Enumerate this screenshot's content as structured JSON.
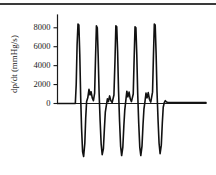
{
  "chart_data": {
    "type": "line",
    "title": "",
    "xlabel": "",
    "ylabel": "dp/dt  (mmHg/s)",
    "ylim": [
      -6000,
      9000
    ],
    "xlim": [
      0,
      100
    ],
    "grid": false,
    "legend": null,
    "yticks": [
      0,
      2000,
      4000,
      6000,
      8000
    ],
    "ytick_labels": [
      "0",
      "2000",
      "4000",
      "6000",
      "8000"
    ],
    "xticks": [],
    "xtick_labels": [],
    "series": [
      {
        "name": "dp/dt",
        "points": [
          [
            0.0,
            0
          ],
          [
            12.0,
            0
          ],
          [
            12.6,
            2000
          ],
          [
            13.2,
            6200
          ],
          [
            13.8,
            8400
          ],
          [
            14.4,
            8300
          ],
          [
            15.0,
            5200
          ],
          [
            15.6,
            700
          ],
          [
            16.2,
            -2600
          ],
          [
            16.9,
            -5100
          ],
          [
            17.6,
            -5600
          ],
          [
            18.4,
            -4200
          ],
          [
            19.0,
            -1500
          ],
          [
            19.6,
            200
          ],
          [
            20.4,
            600
          ],
          [
            21.2,
            1500
          ],
          [
            21.9,
            900
          ],
          [
            22.6,
            1250
          ],
          [
            23.4,
            600
          ],
          [
            24.2,
            300
          ],
          [
            25.0,
            1100
          ],
          [
            25.6,
            4800
          ],
          [
            26.2,
            8200
          ],
          [
            26.8,
            8000
          ],
          [
            27.4,
            5000
          ],
          [
            28.0,
            1200
          ],
          [
            28.7,
            -1800
          ],
          [
            29.4,
            -4300
          ],
          [
            30.1,
            -5400
          ],
          [
            30.9,
            -4800
          ],
          [
            31.6,
            -2600
          ],
          [
            32.2,
            -900
          ],
          [
            32.9,
            -200
          ],
          [
            33.6,
            500
          ],
          [
            34.3,
            200
          ],
          [
            35.1,
            800
          ],
          [
            35.9,
            300
          ],
          [
            36.8,
            100
          ],
          [
            38.0,
            900
          ],
          [
            38.7,
            4500
          ],
          [
            39.3,
            8200
          ],
          [
            39.9,
            8100
          ],
          [
            40.5,
            5400
          ],
          [
            41.1,
            1400
          ],
          [
            41.8,
            -1900
          ],
          [
            42.5,
            -4500
          ],
          [
            43.2,
            -5500
          ],
          [
            44.0,
            -4600
          ],
          [
            44.7,
            -2300
          ],
          [
            45.3,
            -700
          ],
          [
            46.0,
            300
          ],
          [
            46.7,
            1300
          ],
          [
            47.4,
            700
          ],
          [
            48.2,
            1200
          ],
          [
            49.0,
            500
          ],
          [
            49.8,
            200
          ],
          [
            51.0,
            1000
          ],
          [
            51.6,
            4700
          ],
          [
            52.2,
            8100
          ],
          [
            52.8,
            8000
          ],
          [
            53.4,
            5100
          ],
          [
            54.0,
            1100
          ],
          [
            54.7,
            -2100
          ],
          [
            55.4,
            -4600
          ],
          [
            56.1,
            -5500
          ],
          [
            56.9,
            -4500
          ],
          [
            57.6,
            -2200
          ],
          [
            58.2,
            -600
          ],
          [
            58.9,
            200
          ],
          [
            59.6,
            1100
          ],
          [
            60.3,
            600
          ],
          [
            61.1,
            1150
          ],
          [
            61.9,
            450
          ],
          [
            62.8,
            150
          ],
          [
            64.0,
            1200
          ],
          [
            64.6,
            5000
          ],
          [
            65.2,
            8400
          ],
          [
            65.8,
            8300
          ],
          [
            66.4,
            5300
          ],
          [
            67.0,
            1300
          ],
          [
            67.7,
            -1700
          ],
          [
            68.4,
            -4200
          ],
          [
            69.1,
            -5300
          ],
          [
            69.9,
            -4400
          ],
          [
            70.6,
            -2000
          ],
          [
            71.2,
            -400
          ],
          [
            71.9,
            100
          ],
          [
            72.6,
            300
          ],
          [
            73.4,
            150
          ],
          [
            74.5,
            100
          ],
          [
            100.0,
            100
          ]
        ]
      }
    ]
  },
  "figure": {
    "background_color": "#ffffff",
    "trace_color": "#111111",
    "axis_color": "#1a1a1a",
    "top_rule_color": "#3a3a3a"
  }
}
